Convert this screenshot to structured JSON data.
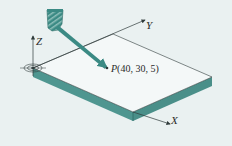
{
  "diagram": {
    "axes": {
      "x_label": "X",
      "y_label": "Y",
      "z_label": "Z"
    },
    "point": {
      "name": "P",
      "coords_text": "(40, 30, 5)",
      "x": 40,
      "y": 30,
      "z": 5
    },
    "colors": {
      "background": "#eaf1f1",
      "slab_side": "#4f9690",
      "slab_top": "#f4f8f8",
      "tool": "#3b8a84",
      "line": "#2f3b3b"
    }
  }
}
